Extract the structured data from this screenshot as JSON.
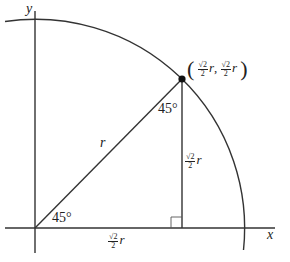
{
  "diagram": {
    "type": "unit-circle-45-degree-triangle",
    "axes": {
      "x_label": "x",
      "y_label": "y"
    },
    "hypotenuse_label": "r",
    "angle_at_origin": "45°",
    "angle_at_point": "45°",
    "horizontal_leg": {
      "num": "√2",
      "den": "2",
      "var": "r"
    },
    "vertical_leg": {
      "num": "√2",
      "den": "2",
      "var": "r"
    },
    "point": {
      "open_paren": "(",
      "close_paren": ")",
      "x": {
        "num": "√2",
        "den": "2",
        "var": "r"
      },
      "separator": ",",
      "y": {
        "num": "√2",
        "den": "2",
        "var": "r"
      }
    },
    "colors": {
      "stroke": "#333333",
      "background": "#ffffff"
    }
  }
}
